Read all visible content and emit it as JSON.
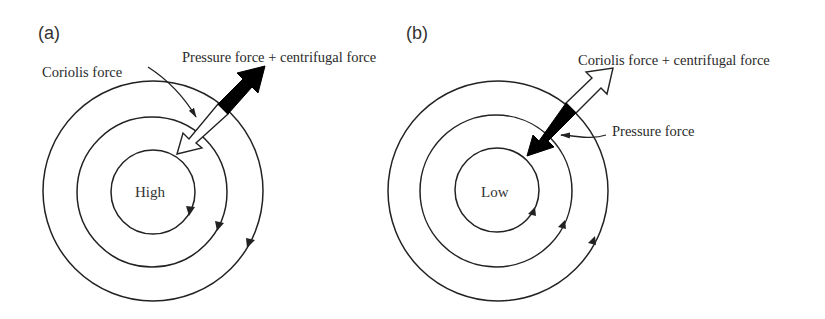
{
  "panels": [
    {
      "id": "a",
      "label": "(a)",
      "center_label": "High",
      "rotation": "clockwise",
      "isobar_count": 3,
      "annotations": {
        "outward_arrow": "Pressure force + centrifugal force",
        "inward_arrow": "Coriolis force"
      },
      "arrow_colors": {
        "outward": "#000000",
        "inward": "#ffffff"
      }
    },
    {
      "id": "b",
      "label": "(b)",
      "center_label": "Low",
      "rotation": "counterclockwise",
      "isobar_count": 3,
      "annotations": {
        "outward_arrow": "Coriolis force + centrifugal force",
        "inward_arrow": "Pressure force"
      },
      "arrow_colors": {
        "outward": "#ffffff",
        "inward": "#000000"
      }
    }
  ]
}
